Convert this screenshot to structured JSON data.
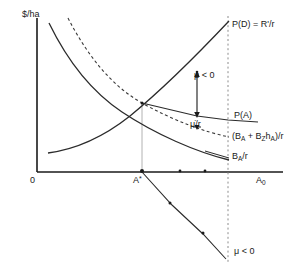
{
  "figure": {
    "axes": {
      "y_axis_label": "$/ha",
      "x_axis_label": "A<sub>0</sub>",
      "origin_label": "0",
      "astar_label": "A<sup>*</sup>"
    },
    "curve_labels": {
      "demand": "P(D) = R'/r",
      "supply_pa": "P(A)",
      "dashed_curve": "(B<sub>A</sub> + B<sub>Z</sub>h<sub>A</sub>)/r",
      "ba_over_r": "B<sub>A</sub>/r"
    },
    "annotations": {
      "mu_gap_upper": "μ < 0",
      "mu_dot_over_r": "μ̇/r",
      "mu_lower_curve": "μ < 0"
    },
    "colors": {
      "ink": "#1a1a1a",
      "curve": "#2b2b2b",
      "guide": "#9a9a9a",
      "background": "#ffffff"
    }
  },
  "chart_data": {
    "type": "line",
    "title": "",
    "xlabel": "A<sub>0</sub>",
    "ylabel": "$/ha",
    "grid": false,
    "legend": "inline-right-labels",
    "xlim": [
      0,
      297
    ],
    "ylim": [
      0,
      273
    ],
    "markers": {
      "x_axis_dots": [
        142,
        180,
        205
      ],
      "intersection_point": [
        142,
        103
      ],
      "arrow_top_point": [
        197,
        73
      ],
      "arrow_bottom_point": [
        197,
        116
      ],
      "lower_line_dots": [
        [
          142,
          172
        ],
        [
          170,
          203
        ],
        [
          203,
          233
        ]
      ]
    },
    "series": [
      {
        "name": "P(D) = R'/r",
        "style": "solid",
        "note": "rising convex curve from lower-left to upper-right",
        "points": [
          [
            48,
            153
          ],
          [
            80,
            143
          ],
          [
            110,
            128
          ],
          [
            140,
            106
          ],
          [
            170,
            80
          ],
          [
            200,
            52
          ],
          [
            228,
            22
          ]
        ]
      },
      {
        "name": "B_A/r",
        "style": "solid",
        "note": "declining convex curve from upper-left to lower-right",
        "points": [
          [
            49,
            23
          ],
          [
            70,
            54
          ],
          [
            95,
            85
          ],
          [
            120,
            108
          ],
          [
            150,
            128
          ],
          [
            185,
            147
          ],
          [
            228,
            160
          ]
        ]
      },
      {
        "name": "(B_A + B_Z h_A)/r",
        "style": "dashed",
        "note": "declining dashed curve above the solid declining curve",
        "points": [
          [
            68,
            18
          ],
          [
            90,
            47
          ],
          [
            115,
            78
          ],
          [
            142,
            103
          ],
          [
            170,
            119
          ],
          [
            200,
            130
          ],
          [
            228,
            137
          ]
        ]
      },
      {
        "name": "P(A)",
        "style": "solid",
        "note": "nearly flat slightly declining segment from intersection to right edge",
        "points": [
          [
            142,
            103
          ],
          [
            197,
            116
          ],
          [
            228,
            120
          ],
          [
            258,
            122
          ]
        ]
      },
      {
        "name": "mu < 0 lower trajectory",
        "style": "solid-with-dots",
        "note": "descending line below the x-axis from A* down past the dashed vertical line",
        "points": [
          [
            142,
            172
          ],
          [
            170,
            203
          ],
          [
            203,
            233
          ],
          [
            228,
            258
          ]
        ]
      }
    ],
    "reference_lines": [
      {
        "name": "vertical-dashed-A0",
        "orientation": "vertical",
        "x": 228,
        "style": "dashed",
        "from_y": 16,
        "to_y": 262
      },
      {
        "name": "vertical-guide-Astar",
        "orientation": "vertical",
        "x": 142,
        "style": "solid-light",
        "from_y": 103,
        "to_y": 172
      },
      {
        "name": "vertical-double-arrow-mu",
        "orientation": "vertical",
        "x": 197,
        "style": "double-arrow",
        "from_y": 73,
        "to_y": 116
      }
    ]
  }
}
